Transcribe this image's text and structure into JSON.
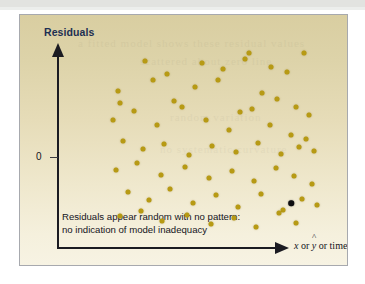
{
  "figure": {
    "y_axis_title": "Residuals",
    "y_zero_label": "0",
    "x_axis_title_parts": {
      "x": "x",
      "or_1": " or ",
      "y": "y",
      "hat": "^",
      "or_2": " or time"
    },
    "caption_line_1": "Residuals appear random with no pattern:",
    "caption_line_2": "no indication of model inadequacy",
    "colors": {
      "dot": "#b79a14",
      "outlier_dot": "#0d0d10",
      "axis": "#1b1b22",
      "title_text": "#1d2f52",
      "body_text": "#14141c",
      "background_top": "#d9cea1",
      "background_bottom": "#f7f3e3",
      "frame_border": "#a7a9ae"
    }
  },
  "chart_data": {
    "type": "scatter",
    "title": "",
    "xlabel": "x or y-hat or time",
    "ylabel": "Residuals",
    "grid": false,
    "legend": "none",
    "annotations": [
      "Residuals appear random with no pattern:",
      "no indication of model inadequacy"
    ],
    "axis_notes": {
      "y_reference_line": 0,
      "y_tick_labels": [
        "0"
      ],
      "x_tick_labels": [],
      "y_arrow": true,
      "x_arrow": true
    },
    "series": [
      {
        "name": "residuals",
        "color": "#b79a14",
        "points": [
          [
            68,
            82
          ],
          [
            99,
            120
          ],
          [
            123,
            104
          ],
          [
            162,
            118
          ],
          [
            186,
            110
          ],
          [
            211,
            122
          ],
          [
            215,
            130
          ],
          [
            240,
            112
          ],
          [
            258,
            106
          ],
          [
            276,
            130
          ],
          [
            71,
            68
          ],
          [
            107,
            96
          ],
          [
            131,
            70
          ],
          [
            155,
            88
          ],
          [
            180,
            96
          ],
          [
            205,
            56
          ],
          [
            229,
            80
          ],
          [
            246,
            72
          ],
          [
            268,
            62
          ],
          [
            282,
            52
          ],
          [
            63,
            46
          ],
          [
            86,
            58
          ],
          [
            112,
            40
          ],
          [
            140,
            62
          ],
          [
            167,
            46
          ],
          [
            193,
            34
          ],
          [
            218,
            60
          ],
          [
            238,
            40
          ],
          [
            262,
            28
          ],
          [
            279,
            22
          ],
          [
            74,
            20
          ],
          [
            96,
            10
          ],
          [
            120,
            16
          ],
          [
            148,
            2
          ],
          [
            174,
            14
          ],
          [
            200,
            6
          ],
          [
            225,
            18
          ],
          [
            251,
            4
          ],
          [
            271,
            12
          ],
          [
            288,
            8
          ],
          [
            66,
            -16
          ],
          [
            90,
            -8
          ],
          [
            116,
            -22
          ],
          [
            143,
            -12
          ],
          [
            170,
            -26
          ],
          [
            196,
            -18
          ],
          [
            221,
            -30
          ],
          [
            245,
            -14
          ],
          [
            265,
            -24
          ],
          [
            285,
            -34
          ],
          [
            79,
            -44
          ],
          [
            103,
            -54
          ],
          [
            127,
            -40
          ],
          [
            152,
            -58
          ],
          [
            178,
            -48
          ],
          [
            203,
            -62
          ],
          [
            228,
            -46
          ],
          [
            253,
            -66
          ],
          [
            274,
            -52
          ],
          [
            291,
            -60
          ],
          [
            70,
            -74
          ],
          [
            94,
            -68
          ],
          [
            118,
            -80
          ],
          [
            146,
            -72
          ],
          [
            172,
            -84
          ],
          [
            198,
            -76
          ],
          [
            223,
            -88
          ],
          [
            249,
            -70
          ],
          [
            268,
            -82
          ]
        ]
      },
      {
        "name": "highlighted-residual",
        "color": "#0d0d10",
        "points": [
          [
            262,
            -58
          ]
        ]
      }
    ]
  }
}
